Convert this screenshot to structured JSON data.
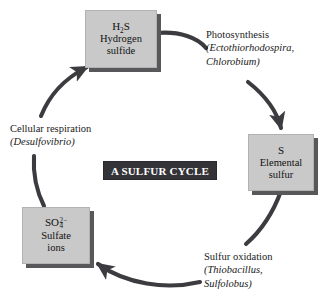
{
  "diagram": {
    "title": "A SULFUR CYCLE",
    "accent_dark": "#343338",
    "box_fill": "#c9c9c9",
    "box_shadow": "#58585a",
    "arrow_color": "#3c3b40",
    "background": "#ffffff",
    "nodes": [
      {
        "id": "h2s",
        "formula_prefix": "H",
        "formula_sub": "2",
        "formula_suffix": "S",
        "line1": "Hydrogen",
        "line2": "sulfide"
      },
      {
        "id": "elemental-sulfur",
        "formula": "S",
        "line1": "Elemental",
        "line2": "sulfur"
      },
      {
        "id": "sulfate-ions",
        "formula_prefix": "SO",
        "formula_sup": "2−",
        "formula_sub": "4",
        "line1": "Sulfate",
        "line2": "ions"
      }
    ],
    "processes": [
      {
        "id": "photosynthesis",
        "name": "Photosynthesis",
        "organisms_line1": "(Ectothiorhodospira,",
        "organisms_line2": "Chlorobium)"
      },
      {
        "id": "sulfur-oxidation",
        "name": "Sulfur oxidation",
        "organisms_line1": "(Thiobacillus,",
        "organisms_line2": "Sulfolobus)"
      },
      {
        "id": "cellular-respiration",
        "name": "Cellular respiration",
        "organisms_line1": "(Desulfovibrio)",
        "organisms_line2": ""
      }
    ],
    "bottom_caption": ""
  }
}
